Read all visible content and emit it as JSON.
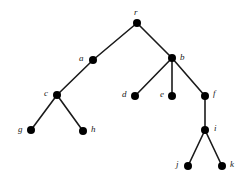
{
  "figure": {
    "type": "node-link-tree",
    "background_color": "#ffffff",
    "node_color": "#000000",
    "edge_color": "#1a1a1a",
    "label_color": "#1a1a1a",
    "node_radius": 4,
    "edge_width": 1.6,
    "width": 250,
    "height": 181
  },
  "nodes": [
    {
      "id": "r",
      "label": "r",
      "x": 137,
      "y": 23,
      "label_x": 134,
      "label_y": 8,
      "label_anchor": "above"
    },
    {
      "id": "a",
      "label": "a",
      "x": 93,
      "y": 60,
      "label_x": 79,
      "label_y": 54,
      "label_anchor": "left"
    },
    {
      "id": "b",
      "label": "b",
      "x": 172,
      "y": 58,
      "label_x": 180,
      "label_y": 53,
      "label_anchor": "right"
    },
    {
      "id": "c",
      "label": "c",
      "x": 57,
      "y": 95,
      "label_x": 44,
      "label_y": 89,
      "label_anchor": "left"
    },
    {
      "id": "d",
      "label": "d",
      "x": 135,
      "y": 96,
      "label_x": 122,
      "label_y": 90,
      "label_anchor": "left"
    },
    {
      "id": "e",
      "label": "e",
      "x": 172,
      "y": 96,
      "label_x": 160,
      "label_y": 90,
      "label_anchor": "left"
    },
    {
      "id": "f",
      "label": "f",
      "x": 205,
      "y": 96,
      "label_x": 213,
      "label_y": 89,
      "label_anchor": "right"
    },
    {
      "id": "g",
      "label": "g",
      "x": 31,
      "y": 130,
      "label_x": 18,
      "label_y": 125,
      "label_anchor": "left"
    },
    {
      "id": "h",
      "label": "h",
      "x": 83,
      "y": 131,
      "label_x": 91,
      "label_y": 125,
      "label_anchor": "right"
    },
    {
      "id": "i",
      "label": "i",
      "x": 205,
      "y": 130,
      "label_x": 214,
      "label_y": 124,
      "label_anchor": "right"
    },
    {
      "id": "j",
      "label": "j",
      "x": 188,
      "y": 166,
      "label_x": 176,
      "label_y": 160,
      "label_anchor": "left"
    },
    {
      "id": "k",
      "label": "k",
      "x": 222,
      "y": 166,
      "label_x": 230,
      "label_y": 160,
      "label_anchor": "right"
    }
  ],
  "edges": [
    {
      "from": "r",
      "to": "a",
      "x1": 137,
      "y1": 23,
      "x2": 93,
      "y2": 60
    },
    {
      "from": "r",
      "to": "b",
      "x1": 137,
      "y1": 23,
      "x2": 172,
      "y2": 58
    },
    {
      "from": "a",
      "to": "c",
      "x1": 93,
      "y1": 60,
      "x2": 57,
      "y2": 95
    },
    {
      "from": "c",
      "to": "g",
      "x1": 57,
      "y1": 95,
      "x2": 31,
      "y2": 130
    },
    {
      "from": "c",
      "to": "h",
      "x1": 57,
      "y1": 95,
      "x2": 83,
      "y2": 131
    },
    {
      "from": "b",
      "to": "d",
      "x1": 172,
      "y1": 58,
      "x2": 135,
      "y2": 96
    },
    {
      "from": "b",
      "to": "e",
      "x1": 172,
      "y1": 58,
      "x2": 172,
      "y2": 96
    },
    {
      "from": "b",
      "to": "f",
      "x1": 172,
      "y1": 58,
      "x2": 205,
      "y2": 96
    },
    {
      "from": "f",
      "to": "i",
      "x1": 205,
      "y1": 96,
      "x2": 205,
      "y2": 130
    },
    {
      "from": "i",
      "to": "j",
      "x1": 205,
      "y1": 130,
      "x2": 188,
      "y2": 166
    },
    {
      "from": "i",
      "to": "k",
      "x1": 205,
      "y1": 130,
      "x2": 222,
      "y2": 166
    }
  ]
}
